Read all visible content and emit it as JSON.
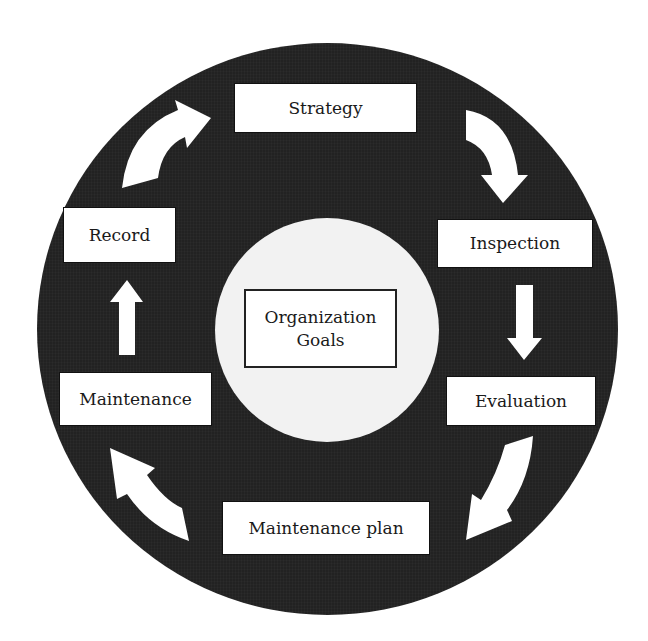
{
  "diagram": {
    "type": "cycle",
    "center": {
      "line1": "Organization",
      "line2": "Goals"
    },
    "steps": [
      {
        "id": "strategy",
        "label": "Strategy"
      },
      {
        "id": "inspection",
        "label": "Inspection"
      },
      {
        "id": "evaluation",
        "label": "Evaluation"
      },
      {
        "id": "maintenance-plan",
        "label": "Maintenance plan"
      },
      {
        "id": "maintenance",
        "label": "Maintenance"
      },
      {
        "id": "record",
        "label": "Record"
      }
    ],
    "flow": [
      [
        "Strategy",
        "Inspection"
      ],
      [
        "Inspection",
        "Evaluation"
      ],
      [
        "Evaluation",
        "Maintenance plan"
      ],
      [
        "Maintenance plan",
        "Maintenance"
      ],
      [
        "Maintenance",
        "Record"
      ],
      [
        "Record",
        "Strategy"
      ]
    ],
    "colors": {
      "ring": "#222222",
      "inner_circle": "#f2f2f2",
      "box": "#ffffff",
      "arrow": "#ffffff",
      "text": "#1a1a1a"
    }
  }
}
